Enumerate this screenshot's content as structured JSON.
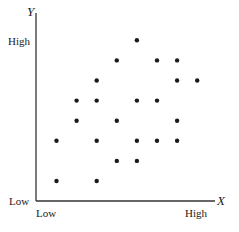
{
  "chart_data": {
    "type": "scatter",
    "title": "",
    "xlabel": "X",
    "ylabel": "Y",
    "x_ticks": [
      "Low",
      "High"
    ],
    "y_ticks": [
      "Low",
      "High"
    ],
    "grid": false,
    "legend": null,
    "xlim": [
      0,
      10
    ],
    "ylim": [
      0,
      10
    ],
    "points": [
      {
        "x": 1,
        "y": 1
      },
      {
        "x": 3,
        "y": 1
      },
      {
        "x": 1,
        "y": 3
      },
      {
        "x": 3,
        "y": 3
      },
      {
        "x": 2,
        "y": 4
      },
      {
        "x": 2,
        "y": 5
      },
      {
        "x": 3,
        "y": 5
      },
      {
        "x": 3,
        "y": 6
      },
      {
        "x": 4,
        "y": 2
      },
      {
        "x": 4,
        "y": 4
      },
      {
        "x": 4,
        "y": 7
      },
      {
        "x": 5,
        "y": 2
      },
      {
        "x": 5,
        "y": 3
      },
      {
        "x": 5,
        "y": 5
      },
      {
        "x": 5,
        "y": 8
      },
      {
        "x": 6,
        "y": 3
      },
      {
        "x": 6,
        "y": 5
      },
      {
        "x": 6,
        "y": 7
      },
      {
        "x": 7,
        "y": 3
      },
      {
        "x": 7,
        "y": 4
      },
      {
        "x": 7,
        "y": 6
      },
      {
        "x": 7,
        "y": 7
      },
      {
        "x": 8,
        "y": 6
      }
    ]
  },
  "labels": {
    "y_axis": "Y",
    "x_axis": "X",
    "y_high": "High",
    "y_low": "Low",
    "x_low": "Low",
    "x_high": "High"
  },
  "colors": {
    "axis": "#333333",
    "point": "#1a1a1a"
  }
}
